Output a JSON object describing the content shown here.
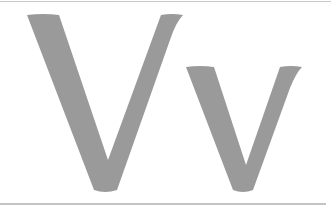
{
  "specimen": {
    "uppercase": "V",
    "lowercase": "v",
    "label": "Vv"
  },
  "colors": {
    "glyph": "#9a9a9a",
    "rule": "#c6c6c6",
    "background": "#ffffff"
  }
}
